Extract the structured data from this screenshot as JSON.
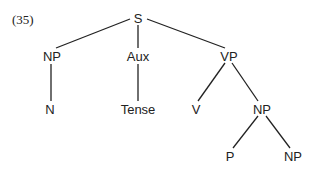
{
  "example_number": "(35)",
  "tree": {
    "nodes": [
      {
        "id": "S",
        "label": "S",
        "x": 138,
        "y": 18
      },
      {
        "id": "NP1",
        "label": "NP",
        "x": 52,
        "y": 56
      },
      {
        "id": "Aux",
        "label": "Aux",
        "x": 138,
        "y": 56
      },
      {
        "id": "VP",
        "label": "VP",
        "x": 229,
        "y": 56
      },
      {
        "id": "N",
        "label": "N",
        "x": 50,
        "y": 109
      },
      {
        "id": "Tense",
        "label": "Tense",
        "x": 138,
        "y": 109
      },
      {
        "id": "V",
        "label": "V",
        "x": 196,
        "y": 109
      },
      {
        "id": "NP2",
        "label": "NP",
        "x": 262,
        "y": 109
      },
      {
        "id": "P",
        "label": "P",
        "x": 230,
        "y": 156
      },
      {
        "id": "NP3",
        "label": "NP",
        "x": 293,
        "y": 156
      }
    ],
    "edges": [
      {
        "from": "S",
        "to": "NP1",
        "x1": 130,
        "y1": 19,
        "x2": 56,
        "y2": 48
      },
      {
        "from": "S",
        "to": "Aux",
        "x1": 138,
        "y1": 25,
        "x2": 138,
        "y2": 48
      },
      {
        "from": "S",
        "to": "VP",
        "x1": 147,
        "y1": 19,
        "x2": 225,
        "y2": 48
      },
      {
        "from": "NP1",
        "to": "N",
        "x1": 51,
        "y1": 64,
        "x2": 51,
        "y2": 101
      },
      {
        "from": "Aux",
        "to": "Tense",
        "x1": 138,
        "y1": 64,
        "x2": 138,
        "y2": 101
      },
      {
        "from": "VP",
        "to": "V",
        "x1": 225,
        "y1": 63,
        "x2": 198,
        "y2": 101
      },
      {
        "from": "VP",
        "to": "NP2",
        "x1": 232,
        "y1": 63,
        "x2": 258,
        "y2": 101
      },
      {
        "from": "NP2",
        "to": "P",
        "x1": 258,
        "y1": 116,
        "x2": 233,
        "y2": 148
      },
      {
        "from": "NP2",
        "to": "NP3",
        "x1": 266,
        "y1": 116,
        "x2": 290,
        "y2": 148
      }
    ]
  }
}
